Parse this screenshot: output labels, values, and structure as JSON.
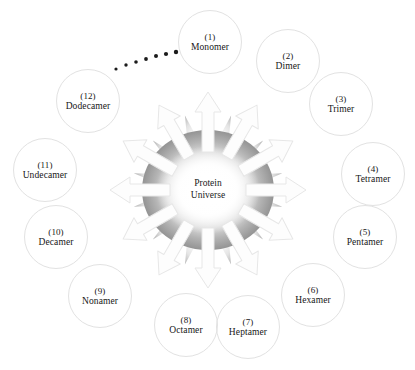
{
  "figure": {
    "background_color": "#ffffff",
    "center": {
      "line1": "Protein",
      "line2": "Universe",
      "burst_edge_color": "#8f8f8f",
      "burst_center_color": "#ffffff",
      "cx": 208,
      "cy": 190
    },
    "arrow": {
      "fill_color": "#fdfdfd",
      "stroke_color": "#e6e6e6",
      "count": 12
    },
    "circle": {
      "diameter": 64,
      "border_color": "#e2e2e2"
    },
    "ellipsis": {
      "name": "continuation-dots",
      "color": "#1b1b1b",
      "count": 7,
      "dots": [
        {
          "cx": 116,
          "cy": 69,
          "r": 1.6
        },
        {
          "cx": 126,
          "cy": 65,
          "r": 1.7
        },
        {
          "cx": 136,
          "cy": 62,
          "r": 1.8
        },
        {
          "cx": 146,
          "cy": 59,
          "r": 1.9
        },
        {
          "cx": 156,
          "cy": 56,
          "r": 2.0
        },
        {
          "cx": 166,
          "cy": 54,
          "r": 2.1
        },
        {
          "cx": 176,
          "cy": 52,
          "r": 2.2
        }
      ]
    },
    "nodes": [
      {
        "index": "(1)",
        "label": "Monomer",
        "cx": 210,
        "cy": 42,
        "name": "node-monomer"
      },
      {
        "index": "(2)",
        "label": "Dimer",
        "cx": 288,
        "cy": 61,
        "name": "node-dimer"
      },
      {
        "index": "(3)",
        "label": "Trimer",
        "cx": 341,
        "cy": 104,
        "name": "node-trimer"
      },
      {
        "index": "(4)",
        "label": "Tetramer",
        "cx": 373,
        "cy": 174,
        "name": "node-tetramer"
      },
      {
        "index": "(5)",
        "label": "Pentamer",
        "cx": 365,
        "cy": 237,
        "name": "node-pentamer"
      },
      {
        "index": "(6)",
        "label": "Hexamer",
        "cx": 313,
        "cy": 295,
        "name": "node-hexamer"
      },
      {
        "index": "(7)",
        "label": "Heptamer",
        "cx": 248,
        "cy": 327,
        "name": "node-heptamer"
      },
      {
        "index": "(8)",
        "label": "Octamer",
        "cx": 186,
        "cy": 325,
        "name": "node-octamer"
      },
      {
        "index": "(9)",
        "label": "Nonamer",
        "cx": 100,
        "cy": 296,
        "name": "node-nonamer"
      },
      {
        "index": "(10)",
        "label": "Decamer",
        "cx": 56,
        "cy": 237,
        "name": "node-decamer"
      },
      {
        "index": "(11)",
        "label": "Undecamer",
        "cx": 45,
        "cy": 170,
        "name": "node-undecamer"
      },
      {
        "index": "(12)",
        "label": "Dodecamer",
        "cx": 88,
        "cy": 101,
        "name": "node-dodecamer"
      }
    ]
  }
}
